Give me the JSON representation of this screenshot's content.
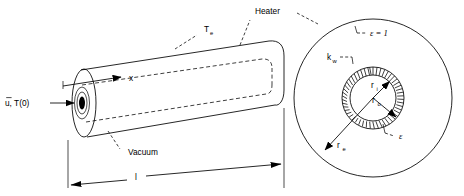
{
  "figure": {
    "title": "",
    "type": "engineering-schematic"
  },
  "labels": {
    "inlet": {
      "text": "u, T(0)",
      "u_symbol": "u",
      "overbar": true,
      "comma": ",",
      "temperature": "T(0)",
      "name": "inlet-velocity-temperature"
    },
    "axis_x": "x",
    "wall_temp": {
      "base": "T",
      "sub": "e"
    },
    "heater": "Heater",
    "vacuum": "Vacuum",
    "length": "l",
    "emissivity_outer": {
      "symbol": "ε",
      "equals": "=",
      "value": "1",
      "full": "ε = 1"
    },
    "emissivity_inner": {
      "symbol": "ε"
    },
    "wall_conductivity": {
      "base": "k",
      "sub": "w"
    },
    "radius_inner": {
      "base": "r",
      "sub": "i"
    },
    "radius_outer": {
      "base": "r",
      "sub": "o"
    },
    "radius_enclosure": {
      "base": "r",
      "sub": "e"
    }
  },
  "geometry": {
    "cylinder": {
      "left_center_x": 84,
      "left_center_y": 103,
      "right_center_x": 272,
      "right_center_y": 72,
      "outer_radius_y": 38,
      "outer_radius_x": 12
    },
    "cross_section": {
      "center_x": 373,
      "center_y": 98,
      "r_enclosure": 79,
      "r_outer": 31,
      "r_inner": 23
    }
  },
  "colors": {
    "line": "#000000",
    "background": "#ffffff",
    "fill": "#000000"
  }
}
